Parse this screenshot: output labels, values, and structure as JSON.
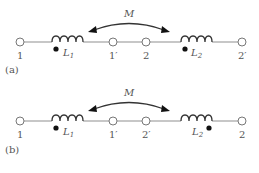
{
  "diagrams": [
    {
      "id": "a",
      "caption": "(a)",
      "mutual_label": "M",
      "terminals": [
        {
          "label": "1"
        },
        {
          "label": "1′"
        },
        {
          "label": "2"
        },
        {
          "label": "2′"
        }
      ],
      "inductors": [
        {
          "label": "L",
          "subscript": "1",
          "dot_position": "left"
        },
        {
          "label": "L",
          "subscript": "2",
          "dot_position": "left"
        }
      ]
    },
    {
      "id": "b",
      "caption": "(b)",
      "mutual_label": "M",
      "terminals": [
        {
          "label": "1"
        },
        {
          "label": "1′"
        },
        {
          "label": "2′"
        },
        {
          "label": "2"
        }
      ],
      "inductors": [
        {
          "label": "L",
          "subscript": "1",
          "dot_position": "left"
        },
        {
          "label": "L",
          "subscript": "2",
          "dot_position": "right"
        }
      ]
    }
  ],
  "colors": {
    "wire": "#9a9a9a",
    "coil": "#333333",
    "dot": "#111111",
    "text": "#555555"
  }
}
